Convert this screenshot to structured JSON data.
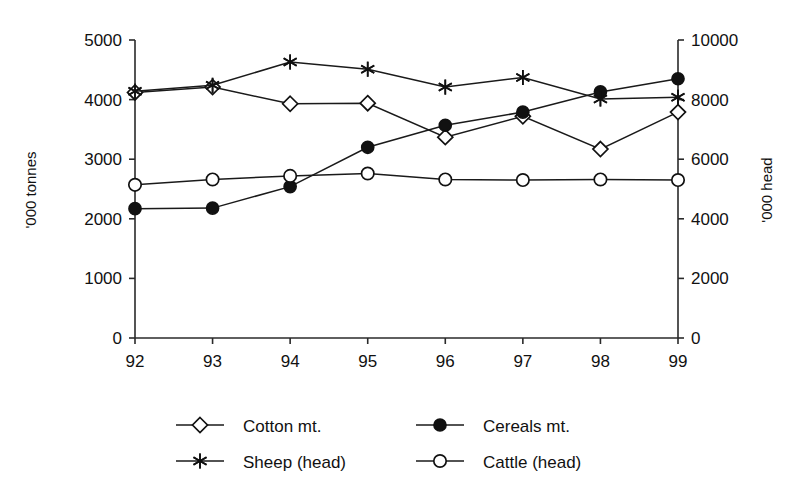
{
  "chart_data": {
    "type": "line",
    "title": "",
    "xlabel": "",
    "ylabel": "'000 tonnes",
    "y2label": "'000 head",
    "categories": [
      "92",
      "93",
      "94",
      "95",
      "96",
      "97",
      "98",
      "99"
    ],
    "xtick_labels": [
      "92",
      "93",
      "94",
      "95",
      "96",
      "97",
      "98",
      "99"
    ],
    "ylim": [
      0,
      5000
    ],
    "ytick_labels": [
      "0",
      "1000",
      "2000",
      "3000",
      "4000",
      "5000"
    ],
    "ytick_values": [
      0,
      1000,
      2000,
      3000,
      4000,
      5000
    ],
    "y2lim": [
      0,
      10000
    ],
    "y2tick_labels": [
      "0",
      "2000",
      "4000",
      "6000",
      "8000",
      "10000"
    ],
    "y2tick_values": [
      0,
      2000,
      4000,
      6000,
      8000,
      10000
    ],
    "grid": false,
    "legend_position": "bottom",
    "series": [
      {
        "name": "Cotton mt.",
        "axis": "left",
        "marker": "open-diamond",
        "unit": "'000 tonnes",
        "values": [
          4120,
          4210,
          3930,
          3940,
          3370,
          3720,
          3170,
          3790
        ]
      },
      {
        "name": "Cereals mt.",
        "axis": "left",
        "marker": "filled-circle",
        "unit": "'000 tonnes",
        "values": [
          2170,
          2180,
          2540,
          3200,
          3570,
          3790,
          4130,
          4350
        ]
      },
      {
        "name": "Sheep (head)",
        "axis": "right",
        "marker": "star",
        "unit": "'000 head",
        "values_left_scale": [
          4140,
          4240,
          4630,
          4510,
          4210,
          4370,
          4010,
          4040
        ],
        "values": [
          8280,
          8480,
          9260,
          9020,
          8420,
          8740,
          8020,
          8080
        ]
      },
      {
        "name": "Cattle (head)",
        "axis": "right",
        "marker": "open-circle",
        "unit": "'000 head",
        "values_left_scale": [
          2570,
          2660,
          2720,
          2760,
          2660,
          2650,
          2660,
          2650
        ],
        "values": [
          5140,
          5320,
          5440,
          5520,
          5320,
          5300,
          5320,
          5300
        ]
      }
    ],
    "legend": [
      {
        "label": "Cotton mt.",
        "marker": "open-diamond"
      },
      {
        "label": "Cereals mt.",
        "marker": "filled-circle"
      },
      {
        "label": "Sheep (head)",
        "marker": "star"
      },
      {
        "label": "Cattle (head)",
        "marker": "open-circle"
      }
    ]
  },
  "colors": {
    "ink": "#111111",
    "axis": "#2a2a2a",
    "background": "#ffffff"
  }
}
